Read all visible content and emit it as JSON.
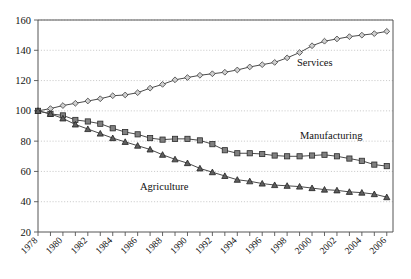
{
  "chart_data": {
    "type": "line",
    "title": "",
    "subtitle": "",
    "xlabel": "",
    "ylabel": "",
    "xlim": [
      1978,
      2006.5
    ],
    "ylim": [
      20,
      160
    ],
    "yticks": [
      20,
      40,
      60,
      80,
      100,
      120,
      140,
      160
    ],
    "xticks": [
      1978,
      1979,
      1980,
      1981,
      1982,
      1983,
      1984,
      1985,
      1986,
      1987,
      1988,
      1989,
      1990,
      1991,
      1992,
      1993,
      1994,
      1995,
      1996,
      1997,
      1998,
      1999,
      2000,
      2001,
      2002,
      2003,
      2004,
      2005,
      2006
    ],
    "xtick_labels": [
      "1978",
      "1980",
      "1982",
      "1984",
      "1986",
      "1988",
      "1990",
      "1992",
      "1994",
      "1996",
      "1998",
      "2000",
      "2002",
      "2004",
      "2006"
    ],
    "grid": "horizontal-dotted",
    "legend_position": "inline-annotation",
    "x": [
      1978,
      1979,
      1980,
      1981,
      1982,
      1983,
      1984,
      1985,
      1986,
      1987,
      1988,
      1989,
      1990,
      1991,
      1992,
      1993,
      1994,
      1995,
      1996,
      1997,
      1998,
      1999,
      2000,
      2001,
      2002,
      2003,
      2004,
      2005,
      2006
    ],
    "series": [
      {
        "name": "Services",
        "marker": "diamond",
        "marker_fill": "#cfcfcf",
        "annotation": "Services",
        "values": [
          100,
          101.5,
          103.5,
          105,
          106.5,
          108,
          110,
          110.5,
          112,
          115,
          117.5,
          120.5,
          122,
          123.5,
          124.5,
          125.5,
          127,
          129,
          130.5,
          132,
          135,
          138.5,
          143,
          146,
          147.5,
          149,
          150,
          151,
          152.5
        ]
      },
      {
        "name": "Manufacturing",
        "marker": "square",
        "marker_fill": "#808080",
        "annotation": "Manufacturing",
        "values": [
          100,
          98,
          97,
          94,
          93,
          91.5,
          88.5,
          86,
          84.5,
          82,
          81,
          81.5,
          81.5,
          80.5,
          78,
          74,
          72,
          72,
          71.5,
          70.5,
          70,
          70,
          70.5,
          71,
          70,
          68.5,
          67,
          64.5,
          63.5
        ]
      },
      {
        "name": "Agriculture",
        "marker": "triangle",
        "marker_fill": "#5e5e5e",
        "annotation": "Agriculture",
        "values": [
          100,
          98,
          95,
          91,
          88,
          85,
          82,
          79.5,
          77,
          74.5,
          71,
          68,
          65.5,
          62,
          59.5,
          57,
          54.5,
          53.5,
          52,
          51,
          50.5,
          50,
          49,
          48,
          47.5,
          46.5,
          46,
          45,
          43
        ]
      }
    ]
  },
  "annotations": {
    "services_label": "Services",
    "manufacturing_label": "Manufacturing",
    "agriculture_label": "Agriculture"
  },
  "colors": {
    "axis": "#555555",
    "grid": "#b5b5b5",
    "line": "#4a4a4a",
    "services_marker": "#cfcfcf",
    "manufacturing_marker": "#808080",
    "agriculture_marker": "#5e5e5e",
    "background": "#ffffff"
  }
}
